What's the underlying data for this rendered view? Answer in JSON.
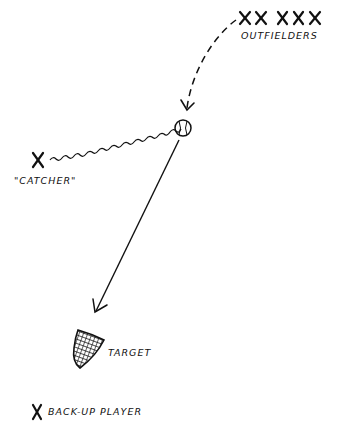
{
  "diagram": {
    "labels": {
      "outfielders": "OUTFIELDERS",
      "catcher": "\"CATCHER\"",
      "target": "TARGET",
      "backup": "BACK-UP PLAYER"
    },
    "markers": {
      "outfielders": [
        "X",
        "X",
        "X",
        "X",
        "X"
      ],
      "catcher": "X",
      "backup": "X"
    },
    "colors": {
      "ink": "#111111",
      "background": "#ffffff"
    }
  }
}
